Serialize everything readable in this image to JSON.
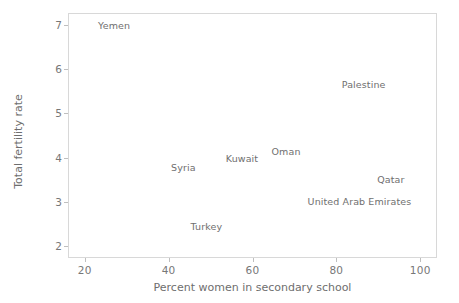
{
  "chart_data": {
    "type": "scatter",
    "title": "",
    "xlabel": "Percent women in secondary school",
    "ylabel": "Total fertility rate",
    "xlim": [
      16,
      104
    ],
    "ylim": [
      1.74,
      7.26
    ],
    "xticks": [
      20,
      40,
      60,
      80,
      100
    ],
    "yticks": [
      2,
      3,
      4,
      5,
      6,
      7
    ],
    "grid": false,
    "legend": null,
    "labels_as_markers": true,
    "points": [
      {
        "label": "Yemen",
        "x": 27.0,
        "y": 6.98
      },
      {
        "label": "Palestine",
        "x": 86.5,
        "y": 5.66
      },
      {
        "label": "Oman",
        "x": 68.0,
        "y": 4.16
      },
      {
        "label": "Kuwait",
        "x": 57.5,
        "y": 4.0
      },
      {
        "label": "Syria",
        "x": 43.5,
        "y": 3.79
      },
      {
        "label": "Qatar",
        "x": 93.0,
        "y": 3.51
      },
      {
        "label": "United Arab Emirates",
        "x": 85.5,
        "y": 3.03
      },
      {
        "label": "Turkey",
        "x": 49.0,
        "y": 2.45
      }
    ]
  },
  "axes": {
    "x_tick_labels": [
      "20",
      "40",
      "60",
      "80",
      "100"
    ],
    "y_tick_labels": [
      "2",
      "3",
      "4",
      "5",
      "6",
      "7"
    ],
    "x_title": "Percent women in secondary school",
    "y_title": "Total fertility rate"
  },
  "colors": {
    "frame": "#d8d8d8",
    "text": "#6f6f6f",
    "tick": "#bfbfbf",
    "background": "#ffffff"
  }
}
